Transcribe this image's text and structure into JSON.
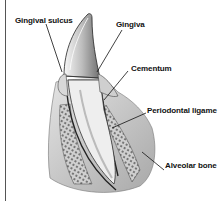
{
  "diagram": {
    "labels": [
      {
        "id": "gingival-sulcus",
        "text": "Gingival sulcus"
      },
      {
        "id": "gingiva",
        "text": "Gingiva"
      },
      {
        "id": "cementum",
        "text": "Cementum"
      },
      {
        "id": "periodontal-ligament",
        "text": "Periodontal ligame"
      },
      {
        "id": "alveolar-bone",
        "text": "Alveolar bone"
      }
    ]
  },
  "colors": {
    "background": "#ffffff",
    "text": "#111111",
    "line": "#1a1a1a",
    "tooth_light": "#f2f2f2",
    "tooth_shade": "#9a9a9a",
    "gum": "#c8c8c8",
    "bone": "#8a8a8a"
  }
}
